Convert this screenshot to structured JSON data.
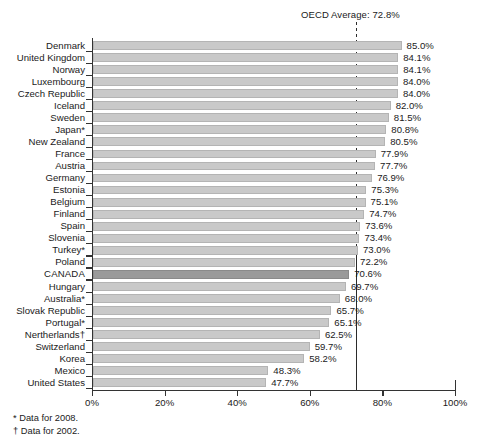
{
  "chart_data": {
    "type": "bar",
    "orientation": "horizontal",
    "title": "",
    "xlabel": "",
    "ylabel": "",
    "xlim": [
      0,
      100
    ],
    "xticks": [
      "0%",
      "20%",
      "40%",
      "60%",
      "80%",
      "100%"
    ],
    "xtick_values": [
      0,
      20,
      40,
      60,
      80,
      100
    ],
    "grid": false,
    "legend": "none",
    "annotation": {
      "oecd_average_label": "OECD Average: 72.8%",
      "oecd_average_value": 72.8
    },
    "highlight_category": "CANADA",
    "categories": [
      "Denmark",
      "United Kingdom",
      "Norway",
      "Luxembourg",
      "Czech Republic",
      "Iceland",
      "Sweden",
      "Japan*",
      "New Zealand",
      "France",
      "Austria",
      "Germany",
      "Estonia",
      "Belgium",
      "Finland",
      "Spain",
      "Slovenia",
      "Turkey*",
      "Poland",
      "CANADA",
      "Hungary",
      "Australia*",
      "Slovak Republic",
      "Portugal*",
      "Nertherlands†",
      "Switzerland",
      "Korea",
      "Mexico",
      "United States"
    ],
    "values": [
      85.0,
      84.1,
      84.1,
      84.0,
      84.0,
      82.0,
      81.5,
      80.8,
      80.5,
      77.9,
      77.7,
      76.9,
      75.3,
      75.1,
      74.7,
      73.6,
      73.4,
      73.0,
      72.2,
      70.6,
      69.7,
      68.0,
      65.7,
      65.1,
      62.5,
      59.7,
      58.2,
      48.3,
      47.7
    ],
    "value_labels": [
      "85.0%",
      "84.1%",
      "84.1%",
      "84.0%",
      "84.0%",
      "82.0%",
      "81.5%",
      "80.8%",
      "80.5%",
      "77.9%",
      "77.7%",
      "76.9%",
      "75.3%",
      "75.1%",
      "74.7%",
      "73.6%",
      "73.4%",
      "73.0%",
      "72.2%",
      "70.6%",
      "69.7%",
      "68.0%",
      "65.7%",
      "65.1%",
      "62.5%",
      "59.7%",
      "58.2%",
      "48.3%",
      "47.7%"
    ]
  },
  "footnotes": [
    "* Data for 2008.",
    "† Data for 2002."
  ],
  "colors": {
    "bar": "#c9c9c9",
    "bar_highlight": "#9a9a9a",
    "axis": "#333333",
    "text": "#1a1a1a",
    "background": "#ffffff"
  }
}
